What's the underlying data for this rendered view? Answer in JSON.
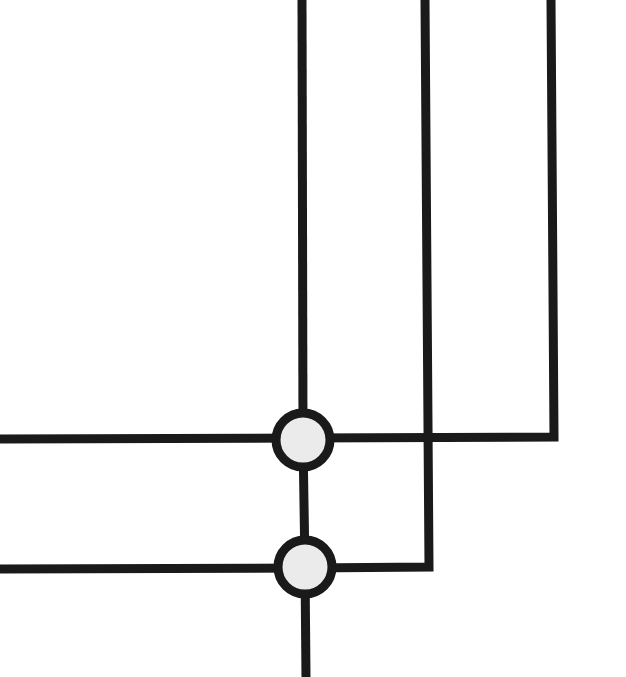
{
  "diagram": {
    "type": "wire-crossing-diagram",
    "background": "#ffffff",
    "stroke_color": "#1a1a1a",
    "node_fill": "#ebebeb",
    "stroke_width": 9,
    "inputs_top": [
      {
        "id": "top-1",
        "x": 302
      },
      {
        "id": "top-2",
        "x": 427
      },
      {
        "id": "top-3",
        "x": 553
      }
    ],
    "inputs_left": [
      {
        "id": "left-1",
        "y": 438
      },
      {
        "id": "left-2",
        "y": 568
      }
    ],
    "output_bottom": {
      "id": "bottom-1",
      "x": 305
    },
    "nodes": [
      {
        "id": "node-1",
        "cx": 303,
        "cy": 440,
        "r": 27
      },
      {
        "id": "node-2",
        "cx": 305,
        "cy": 567,
        "r": 27
      }
    ]
  }
}
